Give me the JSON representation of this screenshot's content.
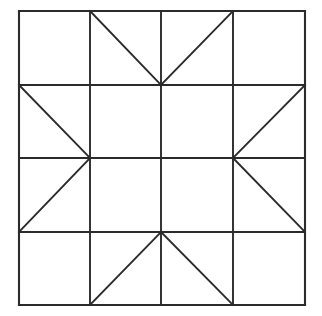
{
  "figure": {
    "type": "line-drawing",
    "background_color": "#ffffff",
    "line_color": "#2b2b2b",
    "canvas": {
      "width": 322,
      "height": 316
    }
  },
  "geometry": {
    "block": {
      "left": 19,
      "top": 11,
      "right": 305,
      "bottom": 305,
      "width": 286,
      "height": 294,
      "rows": 4,
      "columns": 4
    },
    "vertical_grid_x": [
      19,
      90,
      161,
      233,
      305
    ],
    "horizontal_grid_y": [
      11,
      85,
      158,
      232,
      305
    ],
    "border": [
      {
        "name": "top-border",
        "x1": 19,
        "y1": 11,
        "x2": 305,
        "y2": 11
      },
      {
        "name": "right-border",
        "x1": 305,
        "y1": 11,
        "x2": 305,
        "y2": 305
      },
      {
        "name": "bottom-border",
        "x1": 19,
        "y1": 305,
        "x2": 305,
        "y2": 305
      },
      {
        "name": "left-border",
        "x1": 19,
        "y1": 11,
        "x2": 19,
        "y2": 305
      }
    ],
    "grid_lines": [
      {
        "name": "vertical-grid-1",
        "x1": 90,
        "y1": 11,
        "x2": 90,
        "y2": 305
      },
      {
        "name": "vertical-grid-2",
        "x1": 161,
        "y1": 11,
        "x2": 161,
        "y2": 305
      },
      {
        "name": "vertical-grid-3",
        "x1": 233,
        "y1": 11,
        "x2": 233,
        "y2": 305
      },
      {
        "name": "horizontal-grid-1",
        "x1": 19,
        "y1": 85,
        "x2": 305,
        "y2": 85
      },
      {
        "name": "horizontal-grid-2",
        "x1": 19,
        "y1": 158,
        "x2": 305,
        "y2": 158
      },
      {
        "name": "horizontal-grid-3",
        "x1": 19,
        "y1": 232,
        "x2": 305,
        "y2": 232
      }
    ],
    "diagonals": [
      {
        "name": "diagonal-top-left-descending",
        "cell": "row1-col2",
        "x1": 90,
        "y1": 11,
        "x2": 161,
        "y2": 85
      },
      {
        "name": "diagonal-top-right-ascending",
        "cell": "row1-col3",
        "x1": 161,
        "y1": 85,
        "x2": 233,
        "y2": 11
      },
      {
        "name": "diagonal-left-upper-descending",
        "cell": "row2-col1",
        "x1": 19,
        "y1": 85,
        "x2": 90,
        "y2": 158
      },
      {
        "name": "diagonal-right-upper-descending",
        "cell": "row2-col4",
        "x1": 305,
        "y1": 85,
        "x2": 233,
        "y2": 158
      },
      {
        "name": "diagonal-left-lower-ascending",
        "cell": "row3-col1",
        "x1": 90,
        "y1": 158,
        "x2": 19,
        "y2": 232
      },
      {
        "name": "diagonal-right-lower-ascending",
        "cell": "row3-col4",
        "x1": 233,
        "y1": 158,
        "x2": 305,
        "y2": 232
      },
      {
        "name": "diagonal-bottom-left-ascending",
        "cell": "row4-col2",
        "x1": 90,
        "y1": 305,
        "x2": 161,
        "y2": 232
      },
      {
        "name": "diagonal-bottom-right-descending",
        "cell": "row4-col3",
        "x1": 161,
        "y1": 232,
        "x2": 233,
        "y2": 305
      }
    ],
    "empty_cells": [
      "row1-col1",
      "row1-col4",
      "row2-col2",
      "row2-col3",
      "row3-col2",
      "row3-col3",
      "row4-col1",
      "row4-col4"
    ],
    "star_points": [
      {
        "name": "star-point-top",
        "x": 161,
        "y": 85
      },
      {
        "name": "star-point-left",
        "x": 90,
        "y": 158
      },
      {
        "name": "star-point-right",
        "x": 233,
        "y": 158
      },
      {
        "name": "star-point-bottom",
        "x": 161,
        "y": 232
      }
    ]
  }
}
